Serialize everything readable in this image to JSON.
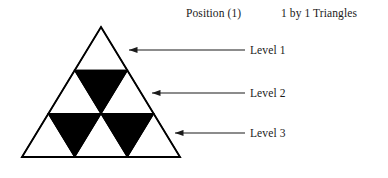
{
  "figure": {
    "header": {
      "position_label": "Position (1)",
      "kind_label": "1 by 1 Triangles"
    },
    "levels": [
      {
        "label": "Level 1",
        "row": 1,
        "white_triangles": 1,
        "black_triangles": 0
      },
      {
        "label": "Level 2",
        "row": 2,
        "white_triangles": 2,
        "black_triangles": 1
      },
      {
        "label": "Level 3",
        "row": 3,
        "white_triangles": 3,
        "black_triangles": 2
      }
    ],
    "colors": {
      "outline": "#000000",
      "fill_black": "#000000",
      "fill_white": "#ffffff",
      "arrow": "#1a1a1a",
      "background": "#ffffff",
      "text": "#1a1a1a"
    },
    "geometry": {
      "apex": [
        101,
        27
      ],
      "base_left": [
        22,
        157
      ],
      "base_right": [
        180,
        157
      ],
      "rows": 3,
      "divider_y": [
        70,
        113.7
      ]
    },
    "arrows": [
      {
        "name": "arrow-level-1",
        "from": [
          245,
          50
        ],
        "to": [
          129,
          50
        ]
      },
      {
        "name": "arrow-level-2",
        "from": [
          245,
          93
        ],
        "to": [
          152,
          93
        ]
      },
      {
        "name": "arrow-level-3",
        "from": [
          245,
          133
        ],
        "to": [
          175,
          133
        ]
      }
    ]
  }
}
